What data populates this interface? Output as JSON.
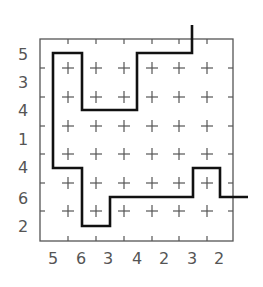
{
  "puzzle": {
    "grid": {
      "cols": 7,
      "rows": 7
    },
    "left_clues": [
      "5",
      "3",
      "4",
      "1",
      "4",
      "6",
      "2"
    ],
    "bottom_clues": [
      "5",
      "6",
      "3",
      "4",
      "2",
      "3",
      "2"
    ],
    "colors": {
      "frame": "#555555",
      "path": "#111111",
      "clue_text": "#555555"
    },
    "path_points": [
      [
        192,
        25
      ],
      [
        192,
        53
      ],
      [
        137,
        53
      ],
      [
        137,
        110
      ],
      [
        82,
        110
      ],
      [
        82,
        53
      ],
      [
        53,
        53
      ],
      [
        53,
        168
      ],
      [
        82,
        168
      ],
      [
        82,
        226
      ],
      [
        110,
        226
      ],
      [
        110,
        197
      ],
      [
        193,
        197
      ],
      [
        193,
        168
      ],
      [
        220,
        168
      ],
      [
        220,
        197
      ],
      [
        248,
        197
      ]
    ]
  }
}
